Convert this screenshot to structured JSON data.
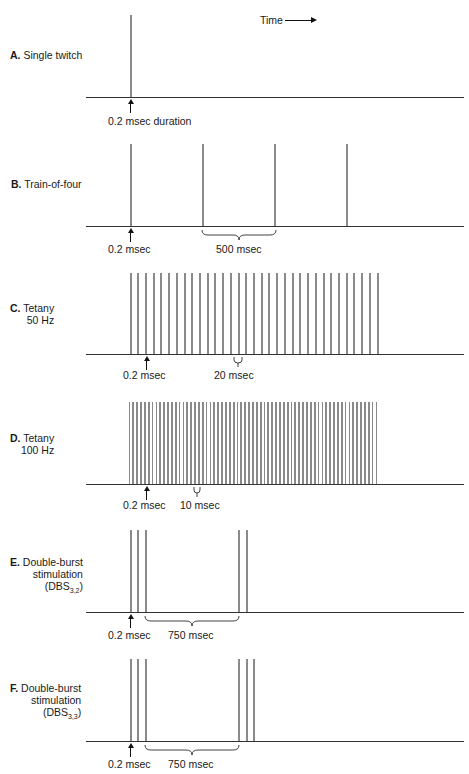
{
  "header": {
    "time_label": "Time"
  },
  "panels": [
    {
      "id": "A",
      "letter": "A.",
      "title": "Single twitch",
      "title2": "",
      "sub": "",
      "pulse_annotation": "0.2 msec duration",
      "interval_annotation": ""
    },
    {
      "id": "B",
      "letter": "B.",
      "title": "Train-of-four",
      "title2": "",
      "sub": "",
      "pulse_annotation": "0.2 msec",
      "interval_annotation": "500 msec"
    },
    {
      "id": "C",
      "letter": "C.",
      "title": "Tetany",
      "title2": "50 Hz",
      "sub": "",
      "pulse_annotation": "0.2 msec",
      "interval_annotation": "20 msec"
    },
    {
      "id": "D",
      "letter": "D.",
      "title": "Tetany",
      "title2": "100 Hz",
      "sub": "",
      "pulse_annotation": "0.2 msec",
      "interval_annotation": "10 msec"
    },
    {
      "id": "E",
      "letter": "E.",
      "title": "Double-burst",
      "title2": "stimulation",
      "title3": "(DBS",
      "sub": "3,2",
      "title3_end": ")",
      "pulse_annotation": "0.2 msec",
      "interval_annotation": "750 msec"
    },
    {
      "id": "F",
      "letter": "F.",
      "title": "Double-burst",
      "title2": "stimulation",
      "title3": "(DBS",
      "sub": "3,3",
      "title3_end": ")",
      "pulse_annotation": "0.2 msec",
      "interval_annotation": "750 msec"
    }
  ],
  "chart_data": {
    "type": "diagram",
    "x_axis": "Time",
    "series": [
      {
        "name": "Single twitch",
        "pulses": 1,
        "pulse_duration_ms": 0.2
      },
      {
        "name": "Train-of-four",
        "pulses": 4,
        "interval_ms": 500,
        "pulse_duration_ms": 0.2
      },
      {
        "name": "Tetany 50 Hz",
        "pulses": 33,
        "interval_ms": 20,
        "pulse_duration_ms": 0.2
      },
      {
        "name": "Tetany 100 Hz",
        "pulses": 65,
        "interval_ms": 10,
        "pulse_duration_ms": 0.2
      },
      {
        "name": "Double-burst stimulation (DBS3,2)",
        "bursts": [
          3,
          2
        ],
        "burst_gap_ms": 750,
        "pulse_duration_ms": 0.2
      },
      {
        "name": "Double-burst stimulation (DBS3,3)",
        "bursts": [
          3,
          3
        ],
        "burst_gap_ms": 750,
        "pulse_duration_ms": 0.2
      }
    ]
  }
}
